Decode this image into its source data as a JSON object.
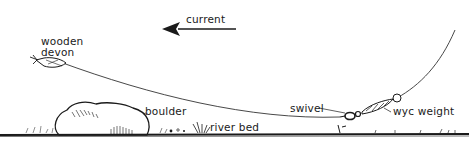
{
  "diagram": {
    "type": "fishing-rig-illustration",
    "labels": {
      "current": "current",
      "wooden_devon_line1": "wooden",
      "wooden_devon_line2": "devon",
      "boulder": "boulder",
      "river_bed": "river bed",
      "swivel": "swivel",
      "wyc_weight": "wyc weight"
    },
    "current_direction": "left",
    "colors": {
      "ink": "#1a1a1a",
      "background": "#ffffff"
    }
  }
}
